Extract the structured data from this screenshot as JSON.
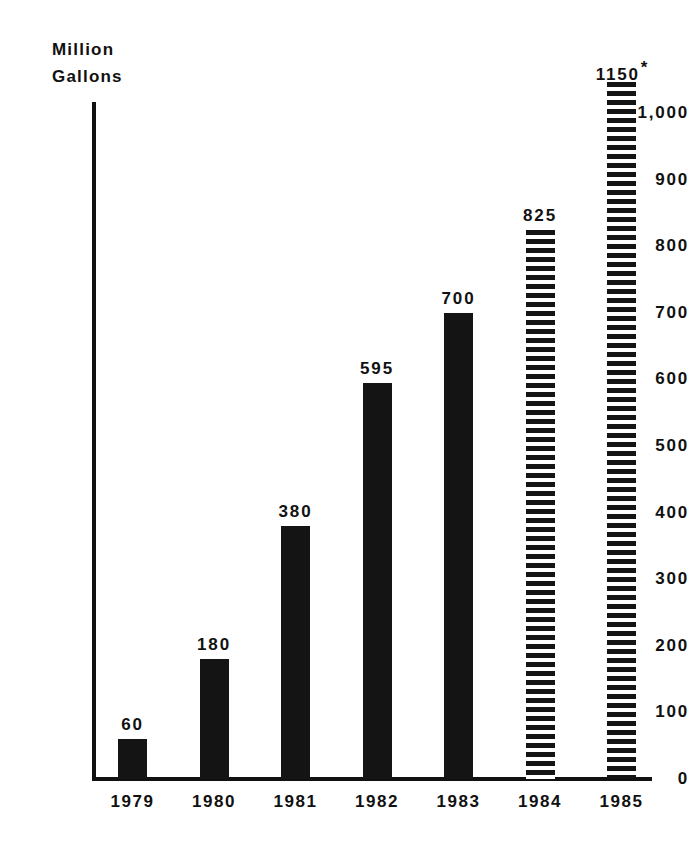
{
  "chart_data": {
    "type": "bar",
    "title": "",
    "xlabel": "",
    "ylabel": "Million Gallons",
    "ylabel_line1": "Million",
    "ylabel_line2": "Gallons",
    "categories": [
      "1979",
      "1980",
      "1981",
      "1982",
      "1983",
      "1984",
      "1985"
    ],
    "values": [
      60,
      180,
      380,
      595,
      700,
      825,
      1150
    ],
    "value_labels": [
      "60",
      "180",
      "380",
      "595",
      "700",
      "825",
      "1150"
    ],
    "bar_styles": [
      "solid",
      "solid",
      "solid",
      "solid",
      "solid",
      "hatched",
      "hatched"
    ],
    "annotations": [
      "",
      "",
      "",
      "",
      "",
      "",
      "*"
    ],
    "ylim": [
      0,
      1000
    ],
    "y_ticks": [
      0,
      100,
      200,
      300,
      400,
      500,
      600,
      700,
      800,
      900,
      1000
    ],
    "y_tick_labels": [
      "0",
      "100",
      "200",
      "300",
      "400",
      "500",
      "600",
      "700",
      "800",
      "900",
      "1,000"
    ],
    "grid": false,
    "legend": false,
    "colors": {
      "bar_solid": "#141414",
      "bar_hatch": "#141414",
      "background": "#ffffff",
      "axis": "#111111",
      "text": "#111111"
    }
  }
}
